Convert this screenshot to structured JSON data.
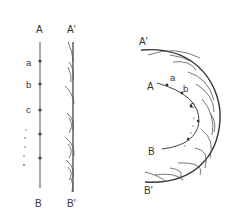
{
  "figure": {
    "colors": {
      "line": "#444444",
      "text": "#333333",
      "background": "#ffffff"
    },
    "plane_wave": {
      "primary_front": {
        "start_label": "A",
        "end_label": "B",
        "point_labels": [
          "a",
          "b",
          "c"
        ]
      },
      "new_front": {
        "start_label": "A′",
        "end_label": "B′"
      }
    },
    "spherical_wave": {
      "primary_front": {
        "start_label": "A",
        "end_label": "B",
        "point_labels": [
          "a",
          "b",
          "c"
        ]
      },
      "new_front": {
        "start_label": "A′",
        "end_label": "B′"
      }
    }
  }
}
